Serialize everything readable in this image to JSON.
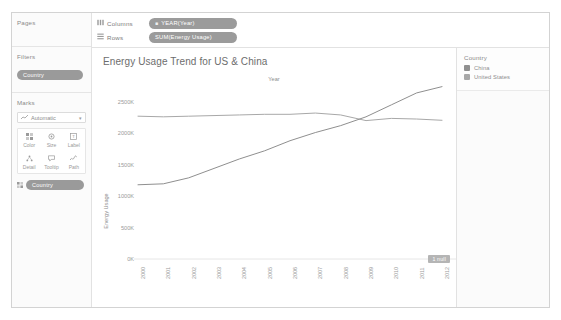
{
  "sidebar": {
    "pages": {
      "title": "Pages"
    },
    "filters": {
      "title": "Filters",
      "pills": [
        {
          "label": "Country"
        }
      ]
    },
    "marks": {
      "title": "Marks",
      "mark_type": "Automatic",
      "mark_type_icon": "line-mark-icon",
      "caret_icon": "chevron-down-icon",
      "buttons": [
        {
          "label": "Color",
          "icon": "color-icon"
        },
        {
          "label": "Size",
          "icon": "size-icon"
        },
        {
          "label": "Label",
          "icon": "label-icon"
        },
        {
          "label": "Detail",
          "icon": "detail-icon"
        },
        {
          "label": "Tooltip",
          "icon": "tooltip-icon"
        },
        {
          "label": "Path",
          "icon": "path-icon"
        }
      ],
      "pills": [
        {
          "label": "Country",
          "icon": "color-icon"
        }
      ]
    }
  },
  "shelves": [
    {
      "name": "Columns",
      "icon": "columns-icon",
      "pill": "YEAR(Year)",
      "pill_glyph": "calendar-icon"
    },
    {
      "name": "Rows",
      "icon": "rows-icon",
      "pill": "SUM(Energy Usage)",
      "pill_glyph": ""
    }
  ],
  "legend": {
    "title": "Country",
    "items": [
      {
        "label": "China",
        "color": "#8f8f8f"
      },
      {
        "label": "United States",
        "color": "#a8a8a8"
      }
    ]
  },
  "viz": {
    "title": "Energy Usage Trend for US & China",
    "x_axis_top_label": "Year",
    "y_axis_title": "Energy Usage",
    "null_badge": "1 null"
  },
  "chart_data": {
    "type": "line",
    "title": "Energy Usage Trend for US & China",
    "xlabel": "Year",
    "ylabel": "Energy Usage",
    "x": [
      2000,
      2001,
      2002,
      2003,
      2004,
      2005,
      2006,
      2007,
      2008,
      2009,
      2010,
      2011,
      2012
    ],
    "ylim": [
      0,
      2750000
    ],
    "yticks": [
      0,
      500000,
      1000000,
      1500000,
      2000000,
      2500000
    ],
    "ytick_labels": [
      "0K",
      "500K",
      "1000K",
      "1500K",
      "2000K",
      "2500K"
    ],
    "grid": false,
    "legend_position": "right",
    "series": [
      {
        "name": "United States",
        "color": "#a8a8a8",
        "values": [
          2270000,
          2260000,
          2270000,
          2280000,
          2290000,
          2300000,
          2300000,
          2320000,
          2290000,
          2200000,
          2235000,
          2225000,
          2205000
        ]
      },
      {
        "name": "China",
        "color": "#8f8f8f",
        "values": [
          1180000,
          1195000,
          1290000,
          1440000,
          1590000,
          1720000,
          1880000,
          2010000,
          2120000,
          2260000,
          2450000,
          2640000,
          2740000
        ]
      }
    ],
    "annotations": [
      {
        "text": "1 null",
        "position": "bottom-right"
      }
    ]
  }
}
